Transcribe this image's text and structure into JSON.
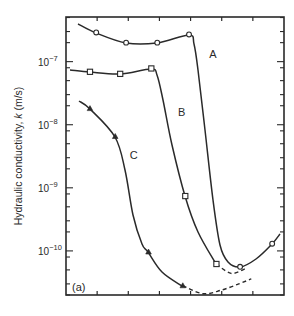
{
  "chart_data": {
    "type": "line",
    "title": "",
    "panel_label": "(a)",
    "xlabel": "",
    "ylabel": "Hydraulic conductivity, k (m/s)",
    "ylabel_parts": {
      "pre": "Hydraulic conductivity, ",
      "italic": "k",
      "post": " (m/s)"
    },
    "yscale": "log",
    "ylim": [
      2e-11,
      5.1e-07
    ],
    "y_ticks": [
      {
        "value": 1e-07,
        "mantissa": "10",
        "exp": "−7"
      },
      {
        "value": 1e-08,
        "mantissa": "10",
        "exp": "−8"
      },
      {
        "value": 1e-09,
        "mantissa": "10",
        "exp": "−9"
      },
      {
        "value": 1e-10,
        "mantissa": "10",
        "exp": "−10"
      }
    ],
    "xlim": [
      0,
      7
    ],
    "x_ticks": [
      1,
      2,
      3,
      4,
      5,
      6
    ],
    "x_tick_labels": [],
    "grid": false,
    "legend": "none",
    "series": [
      {
        "name": "A",
        "marker": "circle",
        "label_pos": {
          "x": 4.6,
          "y": 1.3e-07
        },
        "points": [
          {
            "x": 0.97,
            "y": 2.9e-07
          },
          {
            "x": 1.93,
            "y": 2e-07
          },
          {
            "x": 2.93,
            "y": 2e-07
          },
          {
            "x": 3.95,
            "y": 2.7e-07
          },
          {
            "x": 5.59,
            "y": 5.6e-11
          },
          {
            "x": 6.62,
            "y": 1.3e-10
          }
        ],
        "curve_start": {
          "x": 0.4,
          "y": 4.2e-07
        },
        "curve_end": {
          "x": 6.85,
          "y": 2e-10
        },
        "dashed_extension": []
      },
      {
        "name": "B",
        "marker": "square",
        "label_pos": {
          "x": 3.6,
          "y": 1.6e-08
        },
        "points": [
          {
            "x": 0.77,
            "y": 6.9e-08
          },
          {
            "x": 1.74,
            "y": 6.4e-08
          },
          {
            "x": 2.74,
            "y": 7.8e-08
          },
          {
            "x": 3.83,
            "y": 7.4e-10
          },
          {
            "x": 4.83,
            "y": 6.2e-11
          }
        ],
        "curve_start": {
          "x": 0.35,
          "y": 7.5e-08
        },
        "dashed_extension": [
          {
            "x": 4.83,
            "y": 6.2e-11
          },
          {
            "x": 5.3,
            "y": 4.4e-11
          },
          {
            "x": 5.75,
            "y": 5.2e-11
          }
        ]
      },
      {
        "name": "C",
        "marker": "triangle",
        "label_pos": {
          "x": 2.05,
          "y": 3.3e-09
        },
        "points": [
          {
            "x": 0.77,
            "y": 1.8e-08
          },
          {
            "x": 1.58,
            "y": 6.5e-09
          },
          {
            "x": 2.65,
            "y": 9.6e-11
          },
          {
            "x": 3.75,
            "y": 2.8e-11
          }
        ],
        "curve_start": {
          "x": 0.4,
          "y": 2.4e-08
        },
        "dashed_extension": [
          {
            "x": 3.75,
            "y": 2.8e-11
          },
          {
            "x": 4.4,
            "y": 2.1e-11
          },
          {
            "x": 5.0,
            "y": 2.4e-11
          },
          {
            "x": 5.55,
            "y": 3e-11
          },
          {
            "x": 5.95,
            "y": 3.6e-11
          }
        ]
      }
    ]
  },
  "colors": {
    "ink": "#2a2a2a",
    "background": "#ffffff"
  }
}
